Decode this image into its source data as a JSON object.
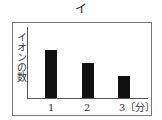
{
  "title": "イ",
  "chart_data": {
    "type": "bar",
    "title": "イ",
    "categories": [
      "1",
      "2",
      "3"
    ],
    "values": [
      48,
      35,
      22
    ],
    "xlabel": "〔分〕",
    "ylabel": "イオンの数",
    "yticks": [],
    "grid": false,
    "legend": "none"
  },
  "labels": {
    "ylabel": "イオンの数",
    "x1": "1",
    "x2": "2",
    "x3": "3〔分〕"
  }
}
